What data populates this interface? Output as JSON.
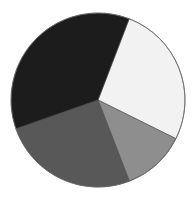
{
  "chart_data": {
    "type": "pie",
    "title": "",
    "xlabel": "",
    "ylabel": "",
    "legend": "none",
    "labels_shown": false,
    "start_angle_deg": -69,
    "direction": "clockwise",
    "center": [
      98,
      100
    ],
    "radius": 87,
    "slices": [
      {
        "name": "Slice 1",
        "value": 26.5,
        "color": "#f2f2f2"
      },
      {
        "name": "Slice 2",
        "value": 11.8,
        "color": "#8e8e8e"
      },
      {
        "name": "Slice 3",
        "value": 25.5,
        "color": "#585858"
      },
      {
        "name": "Slice 4",
        "value": 36.2,
        "color": "#1c1c1c"
      }
    ],
    "categories": [
      "Slice 1",
      "Slice 2",
      "Slice 3",
      "Slice 4"
    ],
    "values": [
      26.5,
      11.8,
      25.5,
      36.2
    ]
  }
}
